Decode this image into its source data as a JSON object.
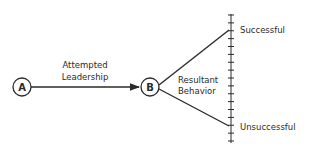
{
  "diagram": {
    "nodes": [
      {
        "id": "A",
        "label": "A"
      },
      {
        "id": "B",
        "label": "B"
      }
    ],
    "edge_label": {
      "line1": "Attempted",
      "line2": "Leadership"
    },
    "branch_label": {
      "line1": "Resultant",
      "line2": "Behavior"
    },
    "scale": {
      "top_label": "Successful",
      "bottom_label": "Unsuccessful",
      "tick_count": 17
    },
    "colors": {
      "ink": "#2a2a2a",
      "background": "#ffffff"
    }
  }
}
